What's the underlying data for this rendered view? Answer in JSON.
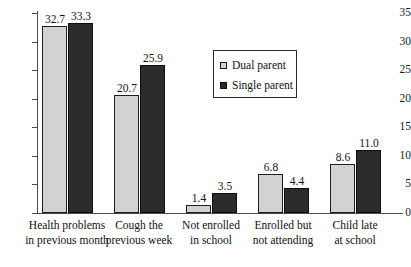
{
  "chart_data": {
    "type": "bar",
    "title": "",
    "subtitle": "",
    "xlabel": "",
    "ylabel": "",
    "ylim": [
      0,
      35
    ],
    "ytick_labels": [
      "0",
      "5",
      "10",
      "15",
      "20",
      "25",
      "30",
      "35"
    ],
    "ytick_values": [
      0,
      5,
      10,
      15,
      20,
      25,
      30,
      35
    ],
    "grid": false,
    "legend_position": "upper-center-right",
    "categories": [
      "Health problems\nin previous month",
      "Cough the\nprevious week",
      "Not enrolled\nin school",
      "Enrolled but\nnot attending",
      "Child late\nat school"
    ],
    "category_lines": [
      [
        "Health problems",
        "in previous month"
      ],
      [
        "Cough the",
        "previous week"
      ],
      [
        "Not enrolled",
        "in school"
      ],
      [
        "Enrolled but",
        "not attending"
      ],
      [
        "Child late",
        "at school"
      ]
    ],
    "series": [
      {
        "name": "Dual parent",
        "color": "#d2d2d2",
        "values": [
          32.7,
          20.7,
          1.4,
          6.8,
          8.6
        ],
        "labels": [
          "32.7",
          "20.7",
          "1.4",
          "6.8",
          "8.6"
        ]
      },
      {
        "name": "Single parent",
        "color": "#2b2b2b",
        "values": [
          33.3,
          25.9,
          3.5,
          4.4,
          11.0
        ],
        "labels": [
          "33.3",
          "25.9",
          "3.5",
          "4.4",
          "11.0"
        ]
      }
    ]
  },
  "legend": {
    "entries": [
      {
        "label": "Dual parent",
        "swatch": "dual"
      },
      {
        "label": "Single parent",
        "swatch": "single"
      }
    ]
  },
  "colors": {
    "dual_parent": "#d2d2d2",
    "single_parent": "#2b2b2b",
    "axis": "#4a4a4a",
    "background": "#ffffff"
  }
}
